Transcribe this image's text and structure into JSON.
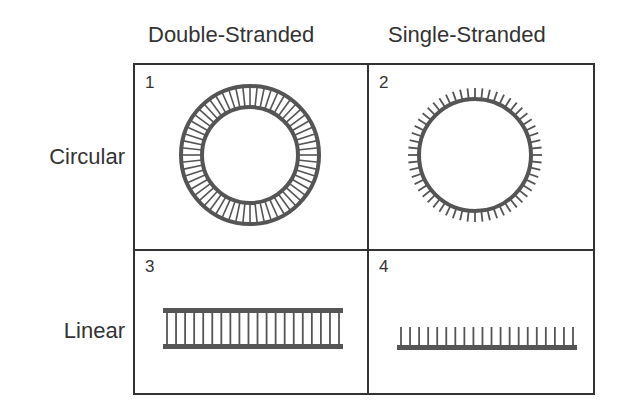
{
  "columns": [
    "Double-Stranded",
    "Single-Stranded"
  ],
  "rows": [
    "Circular",
    "Linear"
  ],
  "cells": [
    {
      "number": "1",
      "type": "double-stranded circular"
    },
    {
      "number": "2",
      "type": "single-stranded circular"
    },
    {
      "number": "3",
      "type": "double-stranded linear"
    },
    {
      "number": "4",
      "type": "single-stranded linear"
    }
  ],
  "colors": {
    "stroke": "#555555",
    "border": "#333333"
  }
}
